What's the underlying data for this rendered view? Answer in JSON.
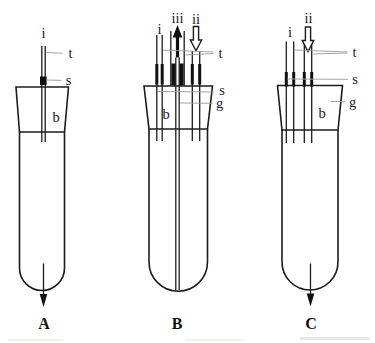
{
  "figure": {
    "type": "apparatus-line-diagram",
    "colors": {
      "line": "#1c1c1c",
      "leader_line": "#9b9b9b",
      "background": "#ffffff"
    },
    "apparatus": {
      "A": {
        "caption": "A",
        "labels": {
          "i": "i",
          "t": "t",
          "s": "s",
          "b": "b"
        }
      },
      "B": {
        "caption": "B",
        "labels": {
          "i": "i",
          "iii": "iii",
          "ii": "ii",
          "t": "t",
          "s": "s",
          "g": "g",
          "b": "b"
        }
      },
      "C": {
        "caption": "C",
        "labels": {
          "i": "i",
          "ii": "ii",
          "t": "t",
          "s": "s",
          "g": "g",
          "b": "b"
        }
      }
    }
  }
}
